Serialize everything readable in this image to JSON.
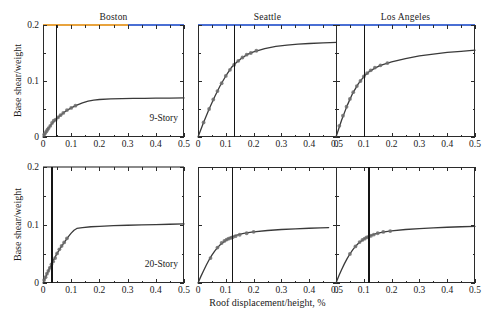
{
  "figure": {
    "axis_title_y": "Base shear/weight",
    "axis_title_x": "Roof displacement/height, %",
    "caption": ""
  },
  "columns": [
    {
      "title": "Boston"
    },
    {
      "title": "Seattle"
    },
    {
      "title": "Los Angeles"
    }
  ],
  "axes": {
    "x_ticks": [
      "0",
      "0.1",
      "0.2",
      "0.3",
      "0.4",
      "0.5"
    ],
    "x_tick_values": [
      0,
      0.1,
      0.2,
      0.3,
      0.4,
      0.5
    ],
    "y_ticks": [
      "0",
      "0.1",
      "0.2"
    ],
    "y_tick_values": [
      0,
      0.1,
      0.2
    ],
    "xlim": [
      0,
      0.5
    ],
    "ylim": [
      0,
      0.2
    ]
  },
  "rows": [
    {
      "story_label": "9-Story"
    },
    {
      "story_label": "20-Story"
    }
  ],
  "panels": [
    {
      "id": "boston-9story",
      "city": "Boston",
      "story": "9-Story",
      "median_label": "Median = 0.0453",
      "median_value": 0.0453,
      "top_edge_colors": [
        "#e8a33d",
        "#4a6fd4"
      ],
      "top_edge_split": 0.6
    },
    {
      "id": "seattle-9story",
      "city": "Seattle",
      "story": "9-Story",
      "median_label": "Median = 0.129",
      "median_value": 0.129,
      "top_edge_colors": [
        "#4a6fd4"
      ],
      "top_edge_split": 1.0
    },
    {
      "id": "losangeles-9story",
      "city": "Los Angeles",
      "story": "9-Story",
      "median_label": "Median = 0.101",
      "median_value": 0.101,
      "top_edge_colors": [
        "#4a6fd4"
      ],
      "top_edge_split": 1.0
    },
    {
      "id": "boston-20story",
      "city": "Boston",
      "story": "20-Story",
      "median_label": "Median = 0.0298",
      "median_value": 0.0298,
      "top_edge_colors": [
        "#8a8a8a"
      ],
      "top_edge_split": 1.0
    },
    {
      "id": "seattle-20story",
      "city": "Seattle",
      "story": "20-Story",
      "median_label": "Median = 0.121",
      "median_value": 0.121,
      "top_edge_colors": [],
      "top_edge_split": 0
    },
    {
      "id": "losangeles-20story",
      "city": "Los Angeles",
      "story": "20-Story",
      "median_label": "Median = 0.116",
      "median_value": 0.116,
      "top_edge_colors": [],
      "top_edge_split": 0
    }
  ],
  "chart_data": {
    "type": "line",
    "title": "",
    "xlabel": "Roof displacement/height, %",
    "ylabel": "Base shear/weight",
    "xlim": [
      0,
      0.5
    ],
    "ylim": [
      0,
      0.2
    ],
    "grid": false,
    "legend": "none",
    "layout": "2 rows (9-Story, 20-Story) x 3 columns (Boston, Seattle, Los Angeles)",
    "annotations": [
      "Median = 0.0453",
      "Median = 0.129",
      "Median = 0.101",
      "Median = 0.0298",
      "Median = 0.121",
      "Median = 0.116",
      "9-Story",
      "20-Story"
    ],
    "series": [
      {
        "name": "Boston 9-Story pushover",
        "row": 0,
        "col": 0,
        "median_x": 0.0453,
        "x": [
          0,
          0.01,
          0.02,
          0.03,
          0.045,
          0.06,
          0.08,
          0.1,
          0.12,
          0.14,
          0.16,
          0.18,
          0.2,
          0.24,
          0.28,
          0.32,
          0.36,
          0.4,
          0.45,
          0.5
        ],
        "y": [
          0,
          0.008,
          0.016,
          0.023,
          0.031,
          0.038,
          0.046,
          0.052,
          0.057,
          0.061,
          0.064,
          0.066,
          0.067,
          0.068,
          0.0685,
          0.069,
          0.069,
          0.0693,
          0.0695,
          0.0697
        ],
        "marker_x": [
          0.004,
          0.008,
          0.012,
          0.016,
          0.02,
          0.026,
          0.032,
          0.038,
          0.045,
          0.053,
          0.062,
          0.072,
          0.085,
          0.1,
          0.115
        ],
        "marker_y": [
          0.004,
          0.007,
          0.01,
          0.013,
          0.016,
          0.02,
          0.025,
          0.029,
          0.031,
          0.035,
          0.039,
          0.043,
          0.048,
          0.052,
          0.056
        ]
      },
      {
        "name": "Seattle 9-Story pushover",
        "row": 0,
        "col": 1,
        "median_x": 0.129,
        "x": [
          0,
          0.02,
          0.04,
          0.06,
          0.08,
          0.1,
          0.12,
          0.14,
          0.16,
          0.18,
          0.2,
          0.24,
          0.28,
          0.32,
          0.36,
          0.4,
          0.45,
          0.5
        ],
        "y": [
          0,
          0.026,
          0.05,
          0.072,
          0.092,
          0.109,
          0.124,
          0.134,
          0.142,
          0.148,
          0.152,
          0.158,
          0.162,
          0.164,
          0.166,
          0.167,
          0.168,
          0.169
        ],
        "marker_x": [
          0.02,
          0.04,
          0.055,
          0.07,
          0.085,
          0.1,
          0.115,
          0.13,
          0.145,
          0.16,
          0.175,
          0.19,
          0.21
        ],
        "marker_y": [
          0.026,
          0.05,
          0.067,
          0.082,
          0.096,
          0.109,
          0.12,
          0.129,
          0.136,
          0.142,
          0.147,
          0.15,
          0.154
        ]
      },
      {
        "name": "Los Angeles 9-Story pushover",
        "row": 0,
        "col": 2,
        "median_x": 0.101,
        "x": [
          0,
          0.02,
          0.04,
          0.06,
          0.08,
          0.1,
          0.12,
          0.14,
          0.16,
          0.18,
          0.2,
          0.25,
          0.3,
          0.35,
          0.4,
          0.45,
          0.5
        ],
        "y": [
          0,
          0.03,
          0.056,
          0.078,
          0.095,
          0.108,
          0.117,
          0.123,
          0.128,
          0.131,
          0.134,
          0.14,
          0.145,
          0.148,
          0.151,
          0.153,
          0.155
        ],
        "marker_x": [
          0.012,
          0.025,
          0.038,
          0.05,
          0.062,
          0.075,
          0.088,
          0.1,
          0.112,
          0.125,
          0.14,
          0.16,
          0.185
        ],
        "marker_y": [
          0.02,
          0.038,
          0.054,
          0.068,
          0.08,
          0.091,
          0.1,
          0.108,
          0.114,
          0.119,
          0.124,
          0.128,
          0.132
        ]
      },
      {
        "name": "Boston 20-Story pushover",
        "row": 1,
        "col": 0,
        "median_x": 0.0298,
        "x": [
          0,
          0.01,
          0.02,
          0.03,
          0.04,
          0.05,
          0.06,
          0.07,
          0.08,
          0.09,
          0.1,
          0.11,
          0.12,
          0.14,
          0.17,
          0.2,
          0.25,
          0.3,
          0.35,
          0.4,
          0.45,
          0.5
        ],
        "y": [
          0,
          0.011,
          0.022,
          0.032,
          0.042,
          0.051,
          0.059,
          0.066,
          0.073,
          0.08,
          0.086,
          0.091,
          0.094,
          0.0955,
          0.097,
          0.0978,
          0.0988,
          0.0996,
          0.1002,
          0.1008,
          0.1013,
          0.1018
        ],
        "marker_x": [
          0.004,
          0.009,
          0.014,
          0.019,
          0.024,
          0.03,
          0.036,
          0.043,
          0.05,
          0.058,
          0.066,
          0.075,
          0.085
        ],
        "marker_y": [
          0.005,
          0.01,
          0.016,
          0.021,
          0.026,
          0.032,
          0.037,
          0.043,
          0.051,
          0.058,
          0.064,
          0.07,
          0.077
        ]
      },
      {
        "name": "Seattle 20-Story pushover",
        "row": 1,
        "col": 1,
        "median_x": 0.121,
        "x": [
          0,
          0.01,
          0.02,
          0.03,
          0.04,
          0.05,
          0.06,
          0.07,
          0.08,
          0.09,
          0.1,
          0.11,
          0.12,
          0.14,
          0.16,
          0.18,
          0.2,
          0.25,
          0.3,
          0.35,
          0.4,
          0.44,
          0.47
        ],
        "y": [
          0,
          0.011,
          0.021,
          0.031,
          0.04,
          0.048,
          0.055,
          0.061,
          0.066,
          0.07,
          0.0735,
          0.0765,
          0.079,
          0.0825,
          0.085,
          0.0868,
          0.0882,
          0.0905,
          0.0922,
          0.0934,
          0.0944,
          0.095,
          0.0955
        ],
        "marker_x": [
          0.045,
          0.07,
          0.085,
          0.095,
          0.103,
          0.11,
          0.118,
          0.125,
          0.135,
          0.15,
          0.175,
          0.2
        ],
        "marker_y": [
          0.043,
          0.061,
          0.069,
          0.0725,
          0.0748,
          0.0765,
          0.0778,
          0.079,
          0.0808,
          0.0832,
          0.0858,
          0.0882
        ]
      },
      {
        "name": "Los Angeles 20-Story pushover",
        "row": 1,
        "col": 2,
        "median_x": 0.116,
        "x": [
          0,
          0.01,
          0.02,
          0.03,
          0.04,
          0.05,
          0.06,
          0.07,
          0.08,
          0.09,
          0.1,
          0.11,
          0.12,
          0.14,
          0.16,
          0.18,
          0.2,
          0.25,
          0.3,
          0.35,
          0.4,
          0.45,
          0.5
        ],
        "y": [
          0,
          0.012,
          0.023,
          0.033,
          0.042,
          0.05,
          0.057,
          0.063,
          0.068,
          0.072,
          0.0755,
          0.0785,
          0.081,
          0.0845,
          0.0868,
          0.0885,
          0.0898,
          0.0922,
          0.0938,
          0.0951,
          0.0961,
          0.097,
          0.0978
        ],
        "marker_x": [
          0.05,
          0.07,
          0.085,
          0.095,
          0.103,
          0.11,
          0.118,
          0.126,
          0.136,
          0.15,
          0.17,
          0.195
        ],
        "marker_y": [
          0.05,
          0.063,
          0.0705,
          0.0742,
          0.0765,
          0.0785,
          0.08,
          0.0815,
          0.0835,
          0.0858,
          0.088,
          0.0896
        ]
      }
    ]
  }
}
